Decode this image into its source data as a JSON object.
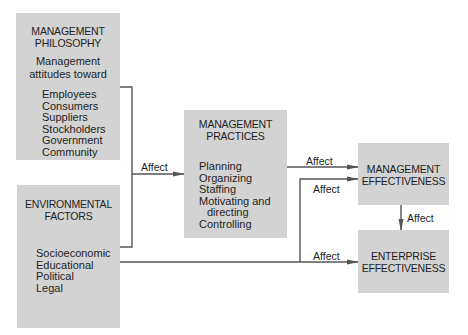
{
  "diagram": {
    "colors": {
      "box": "#d3d3d3",
      "line": "#555555",
      "text": "#1e1e1e"
    },
    "management_philosophy": {
      "title_line1": "MANAGEMENT",
      "title_line2": "PHILOSOPHY",
      "subtitle_line1": "Management",
      "subtitle_line2": "attitudes toward",
      "items": [
        "Employees",
        "Consumers",
        "Suppliers",
        "Stockholders",
        "Government",
        "Community"
      ]
    },
    "environmental_factors": {
      "title_line1": "ENVIRONMENTAL",
      "title_line2": "FACTORS",
      "items": [
        "Socioeconomic",
        "Educational",
        "Political",
        "Legal"
      ]
    },
    "management_practices": {
      "title_line1": "MANAGEMENT",
      "title_line2": "PRACTICES",
      "items": [
        "Planning",
        "Organizing",
        "Staffing",
        "Motivating and",
        "directing",
        "Controlling"
      ]
    },
    "management_effectiveness": {
      "title_line1": "MANAGEMENT",
      "title_line2": "EFFECTIVENESS"
    },
    "enterprise_effectiveness": {
      "title_line1": "ENTERPRISE",
      "title_line2": "EFFECTIVENESS"
    },
    "edges": [
      {
        "label": "Affect",
        "from": "management_philosophy + environmental_factors",
        "to": "management_practices"
      },
      {
        "label": "Affect",
        "from": "management_practices",
        "to": "management_effectiveness"
      },
      {
        "label": "Affect",
        "from": "environmental_factors",
        "to": "management_effectiveness"
      },
      {
        "label": "Affect",
        "from": "management_effectiveness",
        "to": "enterprise_effectiveness"
      },
      {
        "label": "Affect",
        "from": "environmental_factors",
        "to": "enterprise_effectiveness"
      }
    ]
  }
}
